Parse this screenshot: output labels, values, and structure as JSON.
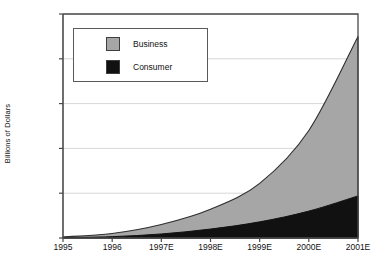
{
  "chart_data": {
    "type": "area",
    "stacked": true,
    "title": "",
    "subtitle": "",
    "xlabel": "",
    "ylabel": "Billions of Dollars",
    "categories": [
      "1995",
      "1996",
      "1997E",
      "1998E",
      "1999E",
      "2000E",
      "2001E"
    ],
    "x_tick_labels": [
      "1995",
      "1996",
      "1997E",
      "1998E",
      "1999E",
      "2000E",
      "2001E"
    ],
    "y_tick_labels": [
      "0",
      "5,000",
      "10,000",
      "15,000",
      "20,000",
      "25,000"
    ],
    "y_tick_values": [
      0,
      5000,
      10000,
      15000,
      20000,
      25000
    ],
    "ylim": [
      0,
      25000
    ],
    "grid": true,
    "grid_axis": "y",
    "legend_position": "upper-left-inside",
    "series": [
      {
        "name": "Consumer",
        "color": "#111111",
        "values": [
          50,
          150,
          450,
          1000,
          1800,
          3000,
          4700
        ]
      },
      {
        "name": "Business",
        "color": "#a6a6a6",
        "values": [
          80,
          350,
          1050,
          2200,
          4300,
          9000,
          17800
        ]
      }
    ],
    "stack_totals": [
      130,
      500,
      1500,
      3200,
      6100,
      12000,
      22500
    ],
    "legend": [
      {
        "label": "Business",
        "color": "#a6a6a6"
      },
      {
        "label": "Consumer",
        "color": "#111111"
      }
    ]
  },
  "colors": {
    "business": "#a6a6a6",
    "consumer": "#111111",
    "axis": "#4a4a4a",
    "grid": "#d8d8d8",
    "text": "#111111"
  }
}
